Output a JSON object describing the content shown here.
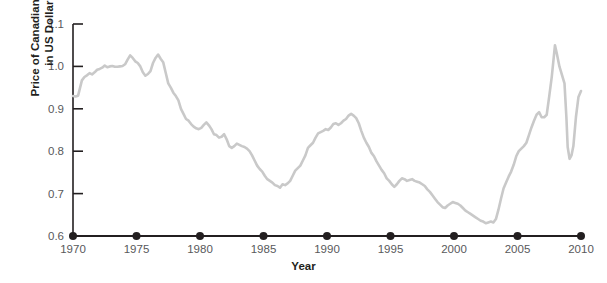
{
  "chart_data": {
    "type": "line",
    "title": "",
    "xlabel": "Year",
    "ylabel": "Price of Canadian Dollar in US Dollars",
    "ylabel_line1": "Price of Canadian Dollar",
    "ylabel_line2": "in US Dollars",
    "xlim": [
      1970,
      2010
    ],
    "ylim": [
      0.6,
      1.1
    ],
    "grid": false,
    "legend": null,
    "line_color": "#c9c9c9",
    "axis_color": "#231f20",
    "tick_label_color": "#58595b",
    "xticks": [
      1970,
      1975,
      1980,
      1985,
      1990,
      1995,
      2000,
      2005,
      2010
    ],
    "xtick_labels": [
      "1970",
      "1975",
      "1980",
      "1985",
      "1990",
      "1995",
      "2000",
      "2005",
      "2010"
    ],
    "yticks": [
      0.6,
      0.7,
      0.8,
      0.9,
      1.0,
      1.1
    ],
    "ytick_labels": [
      "0.6",
      "0.7",
      "0.8",
      "0.9",
      "1.0",
      "1.1"
    ],
    "xtick_marker": "filled-circle",
    "series": [
      {
        "name": "CAD in USD",
        "x": [
          1970.0,
          1970.2,
          1970.4,
          1970.5,
          1970.7,
          1970.9,
          1971.1,
          1971.3,
          1971.5,
          1971.7,
          1971.9,
          1972.1,
          1972.3,
          1972.5,
          1972.7,
          1972.9,
          1973.1,
          1973.3,
          1973.5,
          1973.7,
          1973.9,
          1974.1,
          1974.3,
          1974.5,
          1974.7,
          1974.9,
          1975.1,
          1975.3,
          1975.5,
          1975.7,
          1975.9,
          1976.1,
          1976.3,
          1976.5,
          1976.7,
          1976.9,
          1977.1,
          1977.3,
          1977.5,
          1977.7,
          1977.9,
          1978.1,
          1978.3,
          1978.5,
          1978.7,
          1978.9,
          1979.1,
          1979.3,
          1979.5,
          1979.7,
          1979.9,
          1980.1,
          1980.3,
          1980.5,
          1980.7,
          1980.9,
          1981.1,
          1981.3,
          1981.5,
          1981.7,
          1981.9,
          1982.1,
          1982.3,
          1982.5,
          1982.7,
          1982.9,
          1983.1,
          1983.3,
          1983.5,
          1983.7,
          1983.9,
          1984.1,
          1984.3,
          1984.5,
          1984.7,
          1984.9,
          1985.1,
          1985.3,
          1985.5,
          1985.7,
          1985.9,
          1986.1,
          1986.3,
          1986.5,
          1986.7,
          1986.9,
          1987.1,
          1987.3,
          1987.5,
          1987.7,
          1987.9,
          1988.1,
          1988.3,
          1988.5,
          1988.7,
          1988.9,
          1989.1,
          1989.3,
          1989.5,
          1989.7,
          1989.9,
          1990.1,
          1990.3,
          1990.5,
          1990.7,
          1990.9,
          1991.1,
          1991.3,
          1991.5,
          1991.7,
          1991.9,
          1992.1,
          1992.3,
          1992.5,
          1992.7,
          1992.9,
          1993.1,
          1993.3,
          1993.5,
          1993.7,
          1993.9,
          1994.1,
          1994.3,
          1994.5,
          1994.7,
          1994.9,
          1995.1,
          1995.3,
          1995.5,
          1995.7,
          1995.9,
          1996.1,
          1996.3,
          1996.5,
          1996.7,
          1996.9,
          1997.1,
          1997.3,
          1997.5,
          1997.7,
          1997.9,
          1998.1,
          1998.3,
          1998.5,
          1998.7,
          1998.9,
          1999.1,
          1999.3,
          1999.5,
          1999.7,
          1999.9,
          2000.1,
          2000.3,
          2000.5,
          2000.7,
          2000.9,
          2001.1,
          2001.3,
          2001.5,
          2001.7,
          2001.9,
          2002.1,
          2002.3,
          2002.5,
          2002.7,
          2002.9,
          2003.1,
          2003.3,
          2003.5,
          2003.7,
          2003.9,
          2004.1,
          2004.3,
          2004.5,
          2004.7,
          2004.9,
          2005.1,
          2005.3,
          2005.5,
          2005.7,
          2005.9,
          2006.1,
          2006.3,
          2006.5,
          2006.7,
          2006.9,
          2007.1,
          2007.3,
          2007.5,
          2007.7,
          2007.85,
          2007.95,
          2008.1,
          2008.3,
          2008.5,
          2008.7,
          2008.85,
          2008.95,
          2009.1,
          2009.25,
          2009.4,
          2009.6,
          2009.8,
          2010.0
        ],
        "y": [
          0.93,
          0.929,
          0.931,
          0.943,
          0.967,
          0.975,
          0.979,
          0.984,
          0.981,
          0.986,
          0.992,
          0.994,
          0.997,
          1.002,
          0.998,
          1.0,
          1.001,
          0.999,
          0.999,
          1.0,
          1.001,
          1.005,
          1.016,
          1.026,
          1.02,
          1.012,
          1.008,
          1.0,
          0.986,
          0.978,
          0.982,
          0.989,
          1.008,
          1.02,
          1.028,
          1.018,
          1.01,
          0.985,
          0.96,
          0.95,
          0.938,
          0.93,
          0.92,
          0.9,
          0.888,
          0.876,
          0.872,
          0.864,
          0.858,
          0.854,
          0.852,
          0.855,
          0.862,
          0.868,
          0.861,
          0.852,
          0.84,
          0.838,
          0.832,
          0.834,
          0.84,
          0.828,
          0.812,
          0.808,
          0.812,
          0.818,
          0.815,
          0.812,
          0.81,
          0.806,
          0.8,
          0.79,
          0.778,
          0.766,
          0.758,
          0.752,
          0.742,
          0.734,
          0.73,
          0.726,
          0.72,
          0.718,
          0.714,
          0.722,
          0.72,
          0.724,
          0.73,
          0.742,
          0.754,
          0.76,
          0.766,
          0.778,
          0.79,
          0.808,
          0.814,
          0.82,
          0.832,
          0.842,
          0.845,
          0.848,
          0.852,
          0.85,
          0.856,
          0.864,
          0.866,
          0.862,
          0.866,
          0.872,
          0.876,
          0.884,
          0.888,
          0.884,
          0.878,
          0.866,
          0.848,
          0.832,
          0.82,
          0.81,
          0.796,
          0.788,
          0.776,
          0.766,
          0.756,
          0.748,
          0.736,
          0.73,
          0.722,
          0.716,
          0.722,
          0.73,
          0.736,
          0.734,
          0.73,
          0.732,
          0.734,
          0.73,
          0.728,
          0.726,
          0.722,
          0.718,
          0.71,
          0.704,
          0.696,
          0.688,
          0.68,
          0.674,
          0.668,
          0.666,
          0.672,
          0.676,
          0.68,
          0.678,
          0.676,
          0.672,
          0.666,
          0.66,
          0.656,
          0.652,
          0.648,
          0.644,
          0.64,
          0.636,
          0.634,
          0.63,
          0.632,
          0.634,
          0.632,
          0.64,
          0.662,
          0.688,
          0.712,
          0.726,
          0.74,
          0.752,
          0.768,
          0.788,
          0.8,
          0.806,
          0.812,
          0.82,
          0.838,
          0.856,
          0.872,
          0.886,
          0.892,
          0.88,
          0.88,
          0.886,
          0.93,
          0.976,
          1.02,
          1.05,
          1.03,
          1.0,
          0.98,
          0.96,
          0.88,
          0.81,
          0.782,
          0.79,
          0.812,
          0.88,
          0.928,
          0.942
        ]
      }
    ]
  },
  "axis_geometry": {
    "plot_left_px": 73,
    "plot_right_px": 581,
    "plot_top_px": 24,
    "plot_bottom_px": 236
  }
}
